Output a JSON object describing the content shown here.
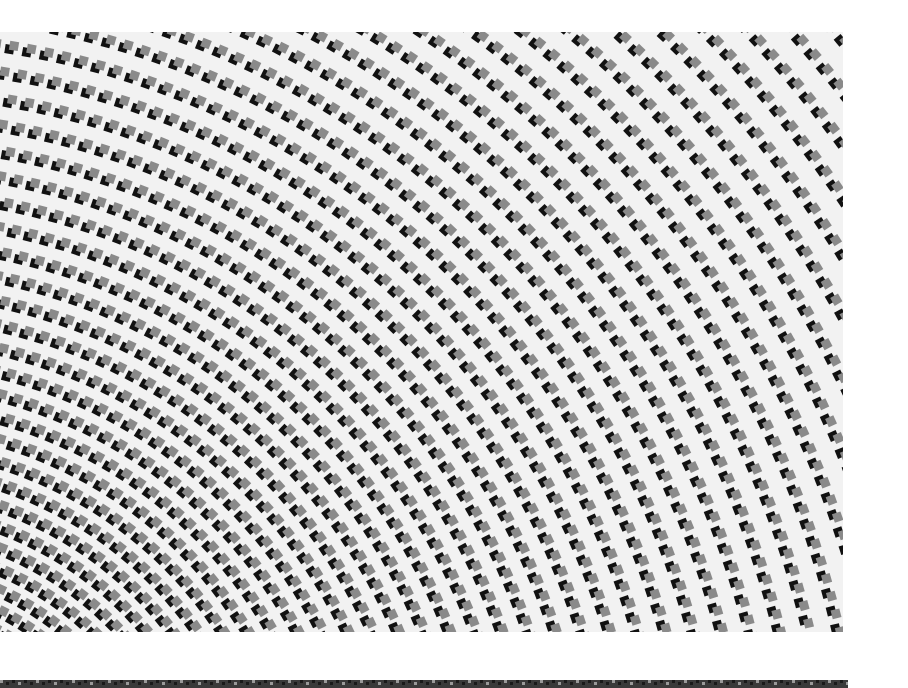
{
  "image": {
    "subject": "aerial photo of heliostat mirror field arranged in concentric arcs",
    "palette": {
      "ground": "#f2f2f2",
      "mirror_dark": "#111111",
      "mirror_light": "#8a8a8a",
      "page_bg": "#ffffff",
      "strip": "#3a3a3a"
    },
    "photo_box": {
      "x": 0,
      "y": 32,
      "w": 843,
      "h": 600
    },
    "field": {
      "center_x": -120,
      "center_y": 820,
      "ring_start_radius": 180,
      "ring_spacing_inner": 17,
      "ring_spacing_growth": 0.35,
      "ring_count": 60,
      "mirror_size": 9
    },
    "bottom_strip": {
      "x": 0,
      "y": 680,
      "w": 848,
      "h": 8
    }
  }
}
